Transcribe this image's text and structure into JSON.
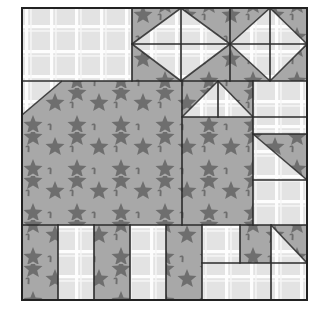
{
  "canvas": {
    "width": 329,
    "height": 318,
    "background": "#ffffff"
  },
  "block": {
    "name": "house-quilt-block",
    "x": 22,
    "y": 8,
    "width": 285,
    "height": 292,
    "outline_color": "#222222",
    "outline_width": 2
  },
  "fabrics": {
    "star": {
      "name": "star-fabric",
      "background": "#a8a8a8",
      "motif_color": "#6e6e6e",
      "motif": "star"
    },
    "plaid": {
      "name": "plaid-fabric",
      "background": "#e4e4e4",
      "line_color": "#fefefe",
      "motif": "grid-plaid"
    }
  },
  "seam": {
    "color": "#2b2b2b",
    "width": 1.6
  },
  "patches": [
    {
      "id": "sky-left-plaid",
      "name": "sky-left-plaid-rectangle",
      "fabric": "plaid",
      "shape": "rect",
      "x": 22,
      "y": 8,
      "w": 110,
      "h": 73
    },
    {
      "id": "hst-r1-c1",
      "name": "half-square-triangle-r1-c1",
      "fabric": "split",
      "shape": "hst",
      "x": 132,
      "y": 8,
      "w": 49,
      "h": 36,
      "orient": "tl-star"
    },
    {
      "id": "hst-r1-c2",
      "name": "half-square-triangle-r1-c2",
      "fabric": "split",
      "shape": "hst",
      "x": 181,
      "y": 8,
      "w": 49,
      "h": 36,
      "orient": "tr-star"
    },
    {
      "id": "hst-r1-c3",
      "name": "half-square-triangle-r1-c3",
      "fabric": "split",
      "shape": "hst",
      "x": 230,
      "y": 8,
      "w": 40,
      "h": 36,
      "orient": "tl-star"
    },
    {
      "id": "hst-r1-c4",
      "name": "half-square-triangle-r1-c4",
      "fabric": "split",
      "shape": "hst",
      "x": 270,
      "y": 8,
      "w": 37,
      "h": 36,
      "orient": "tr-star"
    },
    {
      "id": "hst-r2-c1",
      "name": "half-square-triangle-r2-c1",
      "fabric": "split",
      "shape": "hst",
      "x": 132,
      "y": 44,
      "w": 49,
      "h": 37,
      "orient": "bl-star"
    },
    {
      "id": "hst-r2-c2",
      "name": "half-square-triangle-r2-c2",
      "fabric": "split",
      "shape": "hst",
      "x": 181,
      "y": 44,
      "w": 49,
      "h": 37,
      "orient": "br-star"
    },
    {
      "id": "hst-r2-c3",
      "name": "half-square-triangle-r2-c3",
      "fabric": "split",
      "shape": "hst",
      "x": 230,
      "y": 44,
      "w": 40,
      "h": 37,
      "orient": "bl-star"
    },
    {
      "id": "hst-r2-c4",
      "name": "half-square-triangle-r2-c4",
      "fabric": "split",
      "shape": "hst",
      "x": 270,
      "y": 44,
      "w": 37,
      "h": 37,
      "orient": "br-star"
    },
    {
      "id": "roof-left-corner",
      "name": "roof-left-corner-triangle",
      "fabric": "split",
      "shape": "hst",
      "x": 22,
      "y": 81,
      "w": 40,
      "h": 34,
      "orient": "br-star"
    },
    {
      "id": "roof-body",
      "name": "roof-star-body",
      "fabric": "star",
      "shape": "rect",
      "x": 62,
      "y": 81,
      "w": 120,
      "h": 34
    },
    {
      "id": "hst-r3-c1",
      "name": "half-square-triangle-r3-c1",
      "fabric": "split",
      "shape": "hst",
      "x": 182,
      "y": 81,
      "w": 36,
      "h": 36,
      "orient": "tl-star"
    },
    {
      "id": "hst-r3-c2",
      "name": "half-square-triangle-r3-c2",
      "fabric": "split",
      "shape": "hst",
      "x": 218,
      "y": 81,
      "w": 35,
      "h": 36,
      "orient": "tr-star"
    },
    {
      "id": "chimney-plaid",
      "name": "chimney-plaid-square",
      "fabric": "plaid",
      "shape": "rect",
      "x": 253,
      "y": 81,
      "w": 54,
      "h": 53
    },
    {
      "id": "house-front",
      "name": "house-front-star-panel",
      "fabric": "star",
      "shape": "rect",
      "x": 22,
      "y": 115,
      "w": 160,
      "h": 110
    },
    {
      "id": "house-right-upper",
      "name": "house-right-star-panel",
      "fabric": "star",
      "shape": "rect",
      "x": 182,
      "y": 117,
      "w": 71,
      "h": 108
    },
    {
      "id": "side-wall-hst",
      "name": "side-wall-corner-triangle",
      "fabric": "split",
      "shape": "hst",
      "x": 253,
      "y": 134,
      "w": 54,
      "h": 46,
      "orient": "tr-star"
    },
    {
      "id": "side-wall-plaid",
      "name": "side-wall-plaid-rectangle",
      "fabric": "plaid",
      "shape": "rect",
      "x": 253,
      "y": 180,
      "w": 54,
      "h": 45
    },
    {
      "id": "fence-1-star",
      "name": "fence-post-star-1",
      "fabric": "star",
      "shape": "rect",
      "x": 22,
      "y": 225,
      "w": 36,
      "h": 75
    },
    {
      "id": "fence-2-plaid",
      "name": "fence-post-plaid-1",
      "fabric": "plaid",
      "shape": "rect",
      "x": 58,
      "y": 225,
      "w": 36,
      "h": 75
    },
    {
      "id": "fence-3-star",
      "name": "fence-post-star-2",
      "fabric": "star",
      "shape": "rect",
      "x": 94,
      "y": 225,
      "w": 36,
      "h": 75
    },
    {
      "id": "fence-4-plaid",
      "name": "fence-post-plaid-2",
      "fabric": "plaid",
      "shape": "rect",
      "x": 130,
      "y": 225,
      "w": 36,
      "h": 75
    },
    {
      "id": "fence-5-star",
      "name": "fence-post-star-3",
      "fabric": "star",
      "shape": "rect",
      "x": 166,
      "y": 225,
      "w": 36,
      "h": 75
    },
    {
      "id": "door-plaid",
      "name": "door-plaid-square",
      "fabric": "plaid",
      "shape": "rect",
      "x": 202,
      "y": 225,
      "w": 38,
      "h": 38
    },
    {
      "id": "window-star",
      "name": "window-star-square",
      "fabric": "star",
      "shape": "rect",
      "x": 240,
      "y": 225,
      "w": 31,
      "h": 38
    },
    {
      "id": "step-hst",
      "name": "step-corner-triangle",
      "fabric": "split",
      "shape": "hst",
      "x": 271,
      "y": 225,
      "w": 36,
      "h": 38,
      "orient": "tr-star"
    },
    {
      "id": "path-plaid",
      "name": "path-plaid-rectangle",
      "fabric": "plaid",
      "shape": "rect",
      "x": 202,
      "y": 263,
      "w": 69,
      "h": 37
    },
    {
      "id": "path-plaid-right",
      "name": "path-plaid-right-rectangle",
      "fabric": "plaid",
      "shape": "rect",
      "x": 271,
      "y": 263,
      "w": 36,
      "h": 37
    }
  ],
  "seam_lines": [
    {
      "name": "seam-h-top-sash",
      "x1": 22,
      "y1": 81,
      "x2": 307,
      "y2": 81
    },
    {
      "name": "seam-h-mid-hst",
      "x1": 132,
      "y1": 44,
      "x2": 307,
      "y2": 44
    },
    {
      "name": "seam-h-roof-base",
      "x1": 182,
      "y1": 117,
      "x2": 307,
      "y2": 117
    },
    {
      "name": "seam-h-wall-split",
      "x1": 253,
      "y1": 180,
      "x2": 307,
      "y2": 180
    },
    {
      "name": "seam-h-bottom-row",
      "x1": 22,
      "y1": 225,
      "x2": 307,
      "y2": 225
    },
    {
      "name": "seam-h-door-base",
      "x1": 202,
      "y1": 263,
      "x2": 307,
      "y2": 263
    },
    {
      "name": "seam-h-chimney-base",
      "x1": 253,
      "y1": 134,
      "x2": 307,
      "y2": 134
    },
    {
      "name": "seam-v-sky-right",
      "x1": 132,
      "y1": 8,
      "x2": 132,
      "y2": 81
    },
    {
      "name": "seam-v-hst-1",
      "x1": 181,
      "y1": 8,
      "x2": 181,
      "y2": 81
    },
    {
      "name": "seam-v-hst-2",
      "x1": 230,
      "y1": 8,
      "x2": 230,
      "y2": 81
    },
    {
      "name": "seam-v-hst-3",
      "x1": 270,
      "y1": 8,
      "x2": 270,
      "y2": 81
    },
    {
      "name": "seam-v-roof-right",
      "x1": 182,
      "y1": 81,
      "x2": 182,
      "y2": 225
    },
    {
      "name": "seam-v-roof-mid",
      "x1": 218,
      "y1": 81,
      "x2": 218,
      "y2": 117
    },
    {
      "name": "seam-v-chimney",
      "x1": 253,
      "y1": 81,
      "x2": 253,
      "y2": 225
    },
    {
      "name": "seam-v-fence-1",
      "x1": 58,
      "y1": 225,
      "x2": 58,
      "y2": 300
    },
    {
      "name": "seam-v-fence-2",
      "x1": 94,
      "y1": 225,
      "x2": 94,
      "y2": 300
    },
    {
      "name": "seam-v-fence-3",
      "x1": 130,
      "y1": 225,
      "x2": 130,
      "y2": 300
    },
    {
      "name": "seam-v-fence-4",
      "x1": 166,
      "y1": 225,
      "x2": 166,
      "y2": 300
    },
    {
      "name": "seam-v-door-left",
      "x1": 202,
      "y1": 225,
      "x2": 202,
      "y2": 300
    },
    {
      "name": "seam-v-door-right",
      "x1": 240,
      "y1": 225,
      "x2": 240,
      "y2": 263
    },
    {
      "name": "seam-v-step-left",
      "x1": 271,
      "y1": 225,
      "x2": 271,
      "y2": 300
    }
  ]
}
